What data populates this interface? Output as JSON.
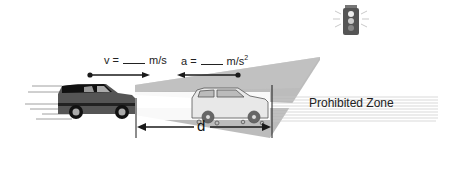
{
  "diagram": {
    "velocity_label": {
      "prefix": "v =",
      "unit": "m/s"
    },
    "acceleration_label": {
      "prefix": "a =",
      "unit": "m/s",
      "unit_superscript": "2"
    },
    "distance_label": "d",
    "zone_label": "Prohibited Zone",
    "icons": {
      "traffic_light": "traffic-light-icon",
      "moving_car": "suv-icon",
      "stopping_car": "suv-outline-icon"
    },
    "colors": {
      "beam": "#a8a8a8",
      "beam_light": "#d0d0d0",
      "car_body": "#4a4a4a",
      "car_dark": "#111111",
      "zone_lines": "#c8c8c8",
      "arrow": "#1a1a1a"
    }
  }
}
